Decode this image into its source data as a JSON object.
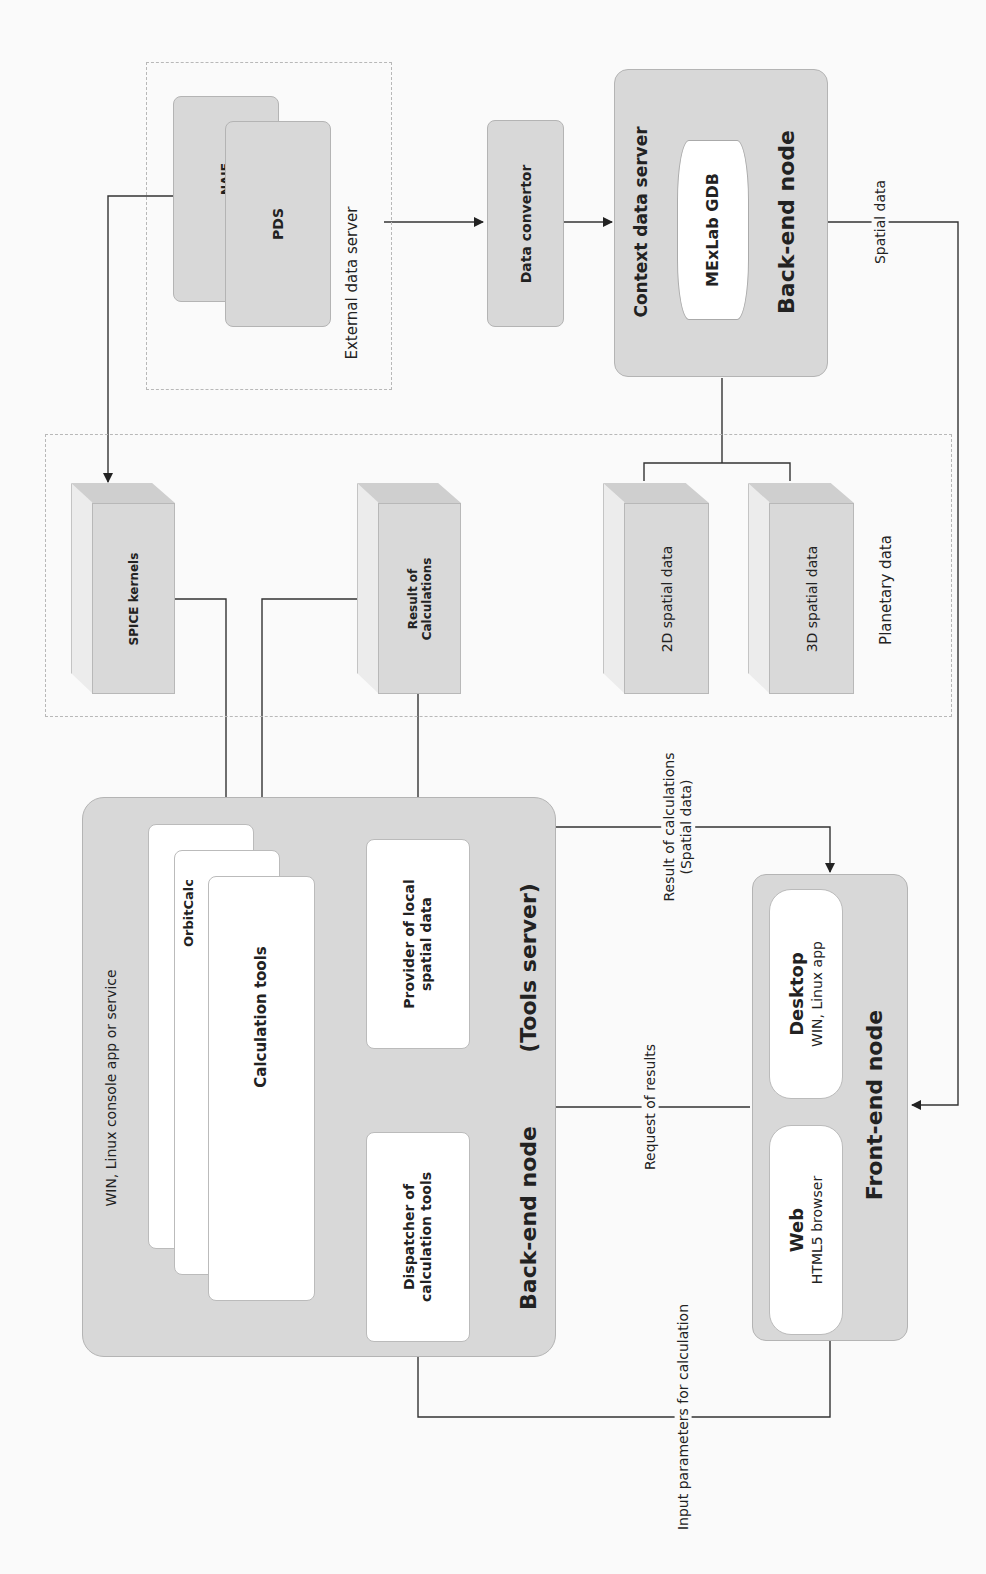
{
  "diagram": {
    "orientation": "rotated 90 degrees counter-clockwise",
    "external_data_server": {
      "label": "External data server",
      "sources": [
        {
          "label": "NAIF"
        },
        {
          "label": "PDS"
        }
      ]
    },
    "data_convertor": {
      "label": "Data convertor"
    },
    "context_data_server": {
      "title": "Context data server",
      "database": "MExLab GDB",
      "node_label": "Back-end node"
    },
    "spatial_data_link": {
      "label": "Spatial data"
    },
    "storage": {
      "spice_kernels": "SPICE kernels",
      "result_of_calculations": "Result of Calculations",
      "spatial_2d": "2D spatial data",
      "spatial_3d": "3D spatial data",
      "planetary_data_label": "Planetary data"
    },
    "tools_server": {
      "platform_label": "WIN, Linux console app or service",
      "orbitcalc": "OrbitCalc",
      "calculation_tools": "Calculation tools",
      "provider": "Provider of local spatial data",
      "dispatcher": "Dispatcher of calculation tools",
      "node_label": "Back-end node",
      "node_sublabel": "(Tools server)"
    },
    "front_end": {
      "desktop_title": "Desktop",
      "desktop_sub": "WIN, Linux app",
      "web_title": "Web",
      "web_sub": "HTML5 browser",
      "node_label": "Front-end node"
    },
    "edges": {
      "result_spatial": "Result of calculations (Spatial data)",
      "result_line1": "Result of calculations",
      "result_line2": "(Spatial data)",
      "request_results": "Request of results",
      "input_params": "Input parameters for calculation"
    },
    "colors": {
      "box_fill": "#d8d8d8",
      "box_border": "#b4b4b4",
      "inner_fill": "#ffffff",
      "line": "#333333",
      "background": "#fafafa"
    }
  }
}
